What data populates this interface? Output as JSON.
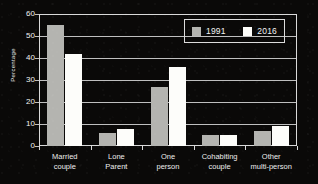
{
  "chart_data": {
    "type": "bar",
    "title": "",
    "xlabel": "",
    "ylabel": "Percentage",
    "ylim": [
      0,
      60
    ],
    "yticks": [
      0,
      10,
      20,
      30,
      40,
      50,
      60
    ],
    "grid": true,
    "legend_position": "top-right",
    "categories": [
      "Married couple",
      "Lone Parent",
      "One person",
      "Cohabiting couple",
      "Other multi-person"
    ],
    "category_lines": [
      [
        "Married",
        "couple"
      ],
      [
        "Lone",
        "Parent"
      ],
      [
        "One",
        "person"
      ],
      [
        "Cohabiting",
        "couple"
      ],
      [
        "Other",
        "multi-person"
      ]
    ],
    "series": [
      {
        "name": "1991",
        "color": "#b4b4b0",
        "values": [
          55,
          6,
          27,
          5,
          7
        ]
      },
      {
        "name": "2016",
        "color": "#fdfdfa",
        "values": [
          42,
          7.5,
          36,
          5,
          9
        ]
      }
    ]
  },
  "axis": {
    "y_title": "Percentage",
    "tick_labels": [
      "60",
      "50",
      "40",
      "30",
      "20",
      "10",
      "0"
    ]
  },
  "legend": {
    "items": [
      {
        "label": "1991",
        "swatch": "gray-swatch"
      },
      {
        "label": "2016",
        "swatch": "white-swatch"
      }
    ]
  },
  "colors": {
    "background": "#0a0908",
    "axis": "#d9d9d9",
    "text": "#f2f2f2",
    "series_1991": "#b4b4b0",
    "series_2016": "#fdfdfa"
  }
}
